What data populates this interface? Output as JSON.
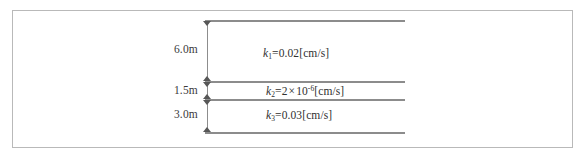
{
  "figure": {
    "type": "soil-layer-cross-section",
    "border_color": "#b9b9b9",
    "line_color": "#8c8c8c",
    "arrow_color": "#575757"
  },
  "layers": [
    {
      "id": "layer-1",
      "thickness": "6.0m",
      "k_symbol": "k",
      "k_subscript": "1",
      "k_equals": "=",
      "k_value": "0.02",
      "k_unit": "[cm/s]",
      "k_full": "k1=0.02[cm/s]"
    },
    {
      "id": "layer-2",
      "thickness": "1.5m",
      "k_symbol": "k",
      "k_subscript": "2",
      "k_equals": "=",
      "k_mantissa": "2",
      "k_times": "×",
      "k_base": "10",
      "k_exponent": "-6",
      "k_unit": "[cm/s]",
      "k_full": "k2=2×10-6[cm/s]"
    },
    {
      "id": "layer-3",
      "thickness": "3.0m",
      "k_symbol": "k",
      "k_subscript": "3",
      "k_equals": "=",
      "k_value": "0.03",
      "k_unit": "[cm/s]",
      "k_full": "k3=0.03[cm/s]"
    }
  ]
}
